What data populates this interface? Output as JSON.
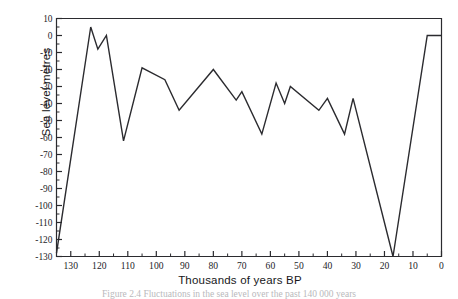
{
  "figure": {
    "caption": "Figure 2.4 Fluctuations in the sea level over the past 140 000 years",
    "y_axis_title": "Sea level metres",
    "x_axis_title": "Thousands of years BP"
  },
  "chart_data": {
    "type": "line",
    "title": "",
    "xlabel": "Thousands of years BP",
    "ylabel": "Sea level metres",
    "xlim": [
      135,
      0
    ],
    "ylim": [
      -130,
      10
    ],
    "x_inverted": true,
    "grid": false,
    "legend": null,
    "y_ticks": [
      10,
      0,
      -10,
      -20,
      -30,
      -40,
      -50,
      -60,
      -70,
      -80,
      -90,
      -100,
      -110,
      -120,
      -130
    ],
    "y_tick_labels": [
      "10",
      "0",
      "-10",
      "-20",
      "-30",
      "-40",
      "-50",
      "-60",
      "-70",
      "-80",
      "-90",
      "-100",
      "-110",
      "-120",
      "-130"
    ],
    "x_ticks": [
      130,
      120,
      110,
      100,
      90,
      80,
      70,
      60,
      50,
      40,
      30,
      20,
      10,
      0
    ],
    "x_tick_labels": [
      "130",
      "120",
      "110",
      "100",
      "90",
      "80",
      "70",
      "60",
      "50",
      "40",
      "30",
      "20",
      "10",
      "0"
    ],
    "x_minor_step": 5,
    "y_minor_step": 5,
    "line_color": "#2b2b2f",
    "line_width": 1.4,
    "series": [
      {
        "name": "Sea level",
        "points": [
          [
            135,
            -128
          ],
          [
            123,
            5
          ],
          [
            120.5,
            -8
          ],
          [
            117.5,
            0
          ],
          [
            111.5,
            -62
          ],
          [
            105,
            -19
          ],
          [
            97,
            -26
          ],
          [
            92,
            -44
          ],
          [
            80,
            -20
          ],
          [
            72,
            -38
          ],
          [
            70,
            -33
          ],
          [
            63,
            -58
          ],
          [
            58,
            -28
          ],
          [
            55,
            -40
          ],
          [
            53,
            -30
          ],
          [
            43,
            -44
          ],
          [
            40,
            -37
          ],
          [
            34,
            -58
          ],
          [
            31,
            -37
          ],
          [
            17,
            -130
          ],
          [
            5,
            0
          ],
          [
            0,
            0
          ]
        ]
      }
    ]
  }
}
